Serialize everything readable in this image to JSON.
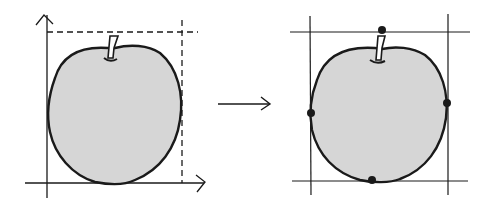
{
  "diagram": {
    "colors": {
      "stroke": "#1a1a1a",
      "fill": "#d6d6d6",
      "background": "#ffffff"
    },
    "left_panel": {
      "type": "axes-with-dashed-bounds",
      "label": ""
    },
    "arrow": {
      "direction": "right",
      "label": ""
    },
    "right_panel": {
      "type": "bounding-lines-with-extreme-points",
      "extreme_points": [
        "top",
        "left",
        "right",
        "bottom"
      ]
    }
  }
}
